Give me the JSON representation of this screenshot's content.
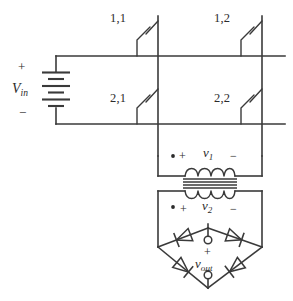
{
  "figure": {
    "kind": "circuit-schematic",
    "background_color": "#ffffff",
    "line_color": "#3a3a3a"
  },
  "source": {
    "name": "dc-voltage-source",
    "label": "V",
    "label_subscript": "in",
    "plus_sign": "+",
    "minus_sign": "−"
  },
  "switches": [
    {
      "name": "switch-1-1",
      "label": "1,1"
    },
    {
      "name": "switch-1-2",
      "label": "1,2"
    },
    {
      "name": "switch-2-1",
      "label": "2,1"
    },
    {
      "name": "switch-2-2",
      "label": "2,2"
    }
  ],
  "transformer": {
    "name": "transformer",
    "primary": {
      "label": "v",
      "label_subscript": "1",
      "plus_sign": "+",
      "minus_sign": "−",
      "polarity_dot": "•"
    },
    "secondary": {
      "label": "v",
      "label_subscript": "2",
      "plus_sign": "+",
      "minus_sign": "−",
      "polarity_dot": "•"
    }
  },
  "rectifier": {
    "name": "bridge-rectifier",
    "diodes": [
      {
        "name": "diode-top-left"
      },
      {
        "name": "diode-top-right"
      },
      {
        "name": "diode-bottom-left"
      },
      {
        "name": "diode-bottom-right"
      }
    ],
    "output": {
      "label": "v",
      "label_subscript": "out",
      "plus_sign": "+",
      "minus_sign": "−"
    }
  }
}
